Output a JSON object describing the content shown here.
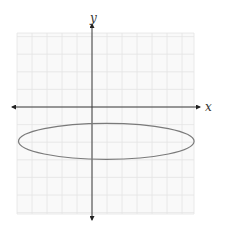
{
  "chart_data": {
    "type": "line",
    "title": "",
    "xlabel": "x",
    "ylabel": "y",
    "grid": true,
    "grid_cells": {
      "left": 5,
      "right": 6.7,
      "up": 4,
      "down": 6
    },
    "ellipse": {
      "center": [
        1,
        -2
      ],
      "semi_major_x": 5.85,
      "semi_minor_y": 1,
      "orientation": "horizontal"
    },
    "axes": {
      "x_arrows": "both",
      "y_arrows": "both",
      "tick_labels": []
    }
  },
  "labels": {
    "x_axis": "x",
    "y_axis": "y"
  },
  "colors": {
    "background": "#ffffff",
    "grid": "#e4e4e4",
    "axis": "#3a3a3a",
    "curve": "#7a7a7a"
  }
}
